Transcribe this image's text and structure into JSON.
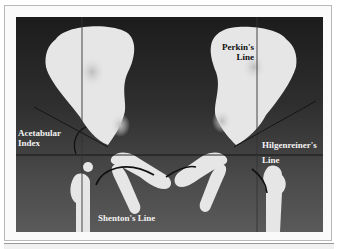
{
  "figure": {
    "labels": {
      "perkins_line": [
        "Perkin's",
        "Line"
      ],
      "acetabular_index": [
        "Acetabular",
        "Index"
      ],
      "hilgenreiners_line": [
        "Hilgenreiner's",
        "Line"
      ],
      "shentons_line": "Shenton's Line"
    },
    "colors": {
      "background_top": "#1c1c1c",
      "background_bottom": "#5a5a5a",
      "bone": "#e6e6e6",
      "line": "#111111",
      "label_light": "#f2f2f2",
      "label_dark": "#111111"
    }
  }
}
